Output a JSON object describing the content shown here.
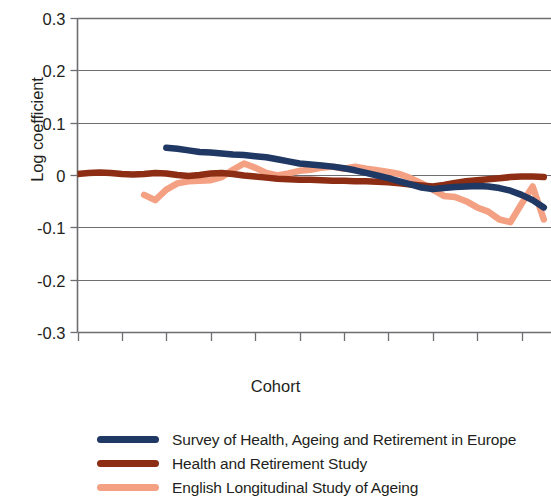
{
  "chart_data": {
    "type": "line",
    "title": "",
    "xlabel": "Cohort",
    "ylabel": "Log coefficient",
    "xlim": [
      1916,
      1960
    ],
    "ylim": [
      -0.3,
      0.3
    ],
    "xticks": [
      1916,
      1920,
      1924,
      1928,
      1932,
      1936,
      1940,
      1944,
      1948,
      1952,
      1956
    ],
    "yticks": [
      0.3,
      0.2,
      0.1,
      0,
      -0.1,
      -0.2,
      -0.3
    ],
    "ytick_labels": [
      "0.3",
      "0.2",
      "0.1",
      "0",
      "-0.1",
      "-0.2",
      "-0.3"
    ],
    "xtick_labels": [
      "1916",
      "1920",
      "1924",
      "1928",
      "1932",
      "1936",
      "1940",
      "1944",
      "1948",
      "1952",
      "1956"
    ],
    "grid": true,
    "grid_axis": "y",
    "legend_position": "below",
    "note": "Right edge of plot is cropped; series continue past 1958.",
    "series": [
      {
        "name": "Survey of Health, Ageing and Retirement in Europe",
        "color": "#1f3864",
        "x": [
          1924,
          1925,
          1926,
          1927,
          1928,
          1929,
          1930,
          1931,
          1932,
          1933,
          1934,
          1935,
          1936,
          1937,
          1938,
          1939,
          1940,
          1941,
          1942,
          1943,
          1944,
          1945,
          1946,
          1947,
          1948,
          1949,
          1950,
          1951,
          1952,
          1953,
          1954,
          1955,
          1956,
          1957,
          1958
        ],
        "values": [
          0.052,
          0.05,
          0.047,
          0.044,
          0.043,
          0.041,
          0.039,
          0.038,
          0.036,
          0.034,
          0.03,
          0.026,
          0.022,
          0.02,
          0.018,
          0.016,
          0.013,
          0.009,
          0.004,
          -0.001,
          -0.006,
          -0.012,
          -0.018,
          -0.024,
          -0.027,
          -0.025,
          -0.023,
          -0.022,
          -0.021,
          -0.022,
          -0.025,
          -0.03,
          -0.038,
          -0.048,
          -0.062
        ]
      },
      {
        "name": "Health and Retirement Study",
        "color": "#8c2d14",
        "x": [
          1916,
          1917,
          1918,
          1919,
          1920,
          1921,
          1922,
          1923,
          1924,
          1925,
          1926,
          1927,
          1928,
          1929,
          1930,
          1931,
          1932,
          1933,
          1934,
          1935,
          1936,
          1937,
          1938,
          1939,
          1940,
          1941,
          1942,
          1943,
          1944,
          1945,
          1946,
          1947,
          1948,
          1949,
          1950,
          1951,
          1952,
          1953,
          1954,
          1955,
          1956,
          1957,
          1958
        ],
        "values": [
          0.002,
          0.004,
          0.005,
          0.004,
          0.002,
          0.001,
          0.002,
          0.004,
          0.003,
          0.0,
          -0.002,
          0.0,
          0.003,
          0.004,
          0.002,
          -0.001,
          -0.003,
          -0.005,
          -0.007,
          -0.008,
          -0.009,
          -0.009,
          -0.01,
          -0.011,
          -0.011,
          -0.012,
          -0.012,
          -0.013,
          -0.014,
          -0.016,
          -0.018,
          -0.02,
          -0.022,
          -0.019,
          -0.015,
          -0.012,
          -0.01,
          -0.008,
          -0.006,
          -0.004,
          -0.003,
          -0.003,
          -0.004
        ]
      },
      {
        "name": "English Longitudinal Study of Ageing",
        "color": "#f4a083",
        "x": [
          1922,
          1923,
          1924,
          1925,
          1926,
          1927,
          1928,
          1929,
          1930,
          1931,
          1932,
          1933,
          1934,
          1935,
          1936,
          1937,
          1938,
          1939,
          1940,
          1941,
          1942,
          1943,
          1944,
          1945,
          1946,
          1947,
          1948,
          1949,
          1950,
          1951,
          1952,
          1953,
          1954,
          1955,
          1956,
          1957,
          1958
        ],
        "values": [
          -0.038,
          -0.048,
          -0.028,
          -0.016,
          -0.012,
          -0.011,
          -0.01,
          -0.004,
          0.01,
          0.022,
          0.014,
          0.004,
          -0.001,
          0.003,
          0.008,
          0.01,
          0.014,
          0.016,
          0.012,
          0.016,
          0.012,
          0.009,
          0.006,
          0.002,
          -0.006,
          -0.016,
          -0.028,
          -0.04,
          -0.042,
          -0.05,
          -0.062,
          -0.07,
          -0.085,
          -0.09,
          -0.055,
          -0.022,
          -0.085
        ]
      }
    ]
  },
  "axes": {
    "y_title": "Log coefficient",
    "x_title": "Cohort"
  },
  "legend": {
    "items": [
      {
        "label": "Survey of Health, Ageing and Retirement in Europe",
        "color": "#1f3864"
      },
      {
        "label": "Health and Retirement Study",
        "color": "#8c2d14"
      },
      {
        "label": "English Longitudinal Study of Ageing",
        "color": "#f4a083"
      }
    ]
  }
}
